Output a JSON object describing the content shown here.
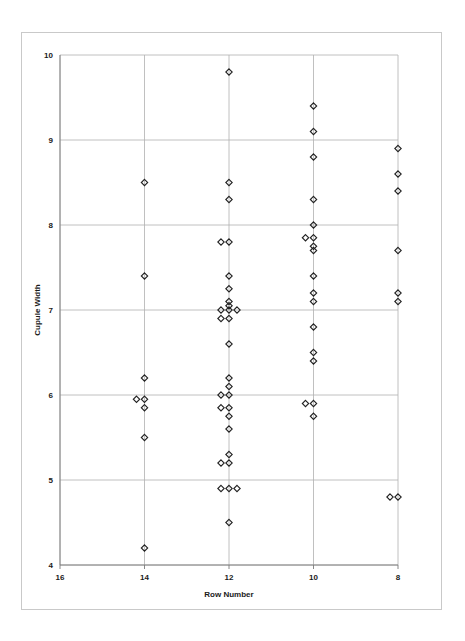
{
  "chart_data": {
    "type": "scatter",
    "title": "",
    "xlabel": "Row Number",
    "ylabel": "Cupule Width",
    "xlim": [
      16,
      8
    ],
    "ylim": [
      4,
      10
    ],
    "x_axis_reversed": true,
    "xticks": [
      16,
      14,
      12,
      10,
      8
    ],
    "xtick_labels": [
      "16",
      "14",
      "12",
      "10",
      "8"
    ],
    "yticks": [
      4,
      5,
      6,
      7,
      8,
      9,
      10
    ],
    "ytick_labels": [
      "4",
      "5",
      "6",
      "7",
      "8",
      "9",
      "10"
    ],
    "grid": "horizontal-and-vertical",
    "legend": "none",
    "marker": "open-diamond",
    "marker_color": "#222222",
    "series": [
      {
        "name": "Cupule Width by Row Number",
        "points": [
          {
            "x": 14,
            "y": 8.5
          },
          {
            "x": 14,
            "y": 7.4
          },
          {
            "x": 14,
            "y": 6.2
          },
          {
            "x": 14,
            "y": 5.95
          },
          {
            "x": 14,
            "y": 5.85
          },
          {
            "x": 14,
            "y": 5.95
          },
          {
            "x": 14,
            "y": 5.5
          },
          {
            "x": 14,
            "y": 4.2
          },
          {
            "x": 12,
            "y": 9.8
          },
          {
            "x": 12,
            "y": 8.5
          },
          {
            "x": 12,
            "y": 8.3
          },
          {
            "x": 12,
            "y": 7.8
          },
          {
            "x": 12,
            "y": 7.8
          },
          {
            "x": 12,
            "y": 7.4
          },
          {
            "x": 12,
            "y": 7.25
          },
          {
            "x": 12,
            "y": 7.1
          },
          {
            "x": 12,
            "y": 7.05
          },
          {
            "x": 12,
            "y": 7.0
          },
          {
            "x": 12,
            "y": 7.0
          },
          {
            "x": 12,
            "y": 7.0
          },
          {
            "x": 12,
            "y": 6.9
          },
          {
            "x": 12,
            "y": 6.9
          },
          {
            "x": 12,
            "y": 6.6
          },
          {
            "x": 12,
            "y": 6.2
          },
          {
            "x": 12,
            "y": 6.1
          },
          {
            "x": 12,
            "y": 6.0
          },
          {
            "x": 12,
            "y": 6.0
          },
          {
            "x": 12,
            "y": 5.85
          },
          {
            "x": 12,
            "y": 5.85
          },
          {
            "x": 12,
            "y": 5.75
          },
          {
            "x": 12,
            "y": 5.6
          },
          {
            "x": 12,
            "y": 5.3
          },
          {
            "x": 12,
            "y": 5.2
          },
          {
            "x": 12,
            "y": 5.2
          },
          {
            "x": 12,
            "y": 4.9
          },
          {
            "x": 12,
            "y": 4.9
          },
          {
            "x": 12,
            "y": 4.9
          },
          {
            "x": 12,
            "y": 4.5
          },
          {
            "x": 10,
            "y": 9.4
          },
          {
            "x": 10,
            "y": 9.1
          },
          {
            "x": 10,
            "y": 8.8
          },
          {
            "x": 10,
            "y": 8.3
          },
          {
            "x": 10,
            "y": 8.0
          },
          {
            "x": 10,
            "y": 7.85
          },
          {
            "x": 10,
            "y": 7.85
          },
          {
            "x": 10,
            "y": 7.75
          },
          {
            "x": 10,
            "y": 7.7
          },
          {
            "x": 10,
            "y": 7.4
          },
          {
            "x": 10,
            "y": 7.2
          },
          {
            "x": 10,
            "y": 7.1
          },
          {
            "x": 10,
            "y": 6.8
          },
          {
            "x": 10,
            "y": 6.5
          },
          {
            "x": 10,
            "y": 6.4
          },
          {
            "x": 10,
            "y": 5.9
          },
          {
            "x": 10,
            "y": 5.9
          },
          {
            "x": 10,
            "y": 5.75
          },
          {
            "x": 8,
            "y": 8.9
          },
          {
            "x": 8,
            "y": 8.6
          },
          {
            "x": 8,
            "y": 8.4
          },
          {
            "x": 8,
            "y": 7.7
          },
          {
            "x": 8,
            "y": 7.2
          },
          {
            "x": 8,
            "y": 7.1
          },
          {
            "x": 8,
            "y": 4.8
          },
          {
            "x": 8,
            "y": 4.8
          }
        ]
      }
    ]
  },
  "layout": {
    "plot_left": 60,
    "plot_right": 398,
    "plot_top": 55,
    "plot_bottom": 565
  }
}
